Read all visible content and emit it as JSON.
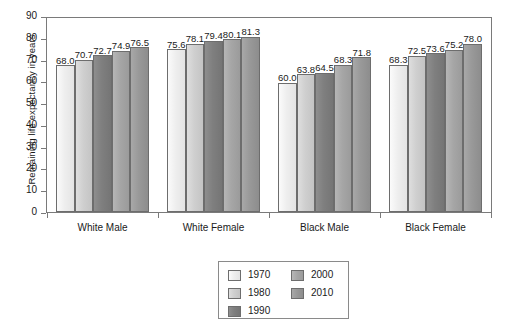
{
  "chart_data": {
    "type": "bar",
    "title": "",
    "xlabel": "",
    "ylabel": "Remaining life expectancy in years",
    "ylim": [
      0,
      90
    ],
    "yticks": [
      0,
      10,
      20,
      30,
      40,
      50,
      60,
      70,
      80,
      90
    ],
    "grid": false,
    "legend_position": "bottom-center",
    "categories": [
      "White Male",
      "White Female",
      "Black Male",
      "Black Female"
    ],
    "series": [
      {
        "name": "1970",
        "color": "#eeeeee",
        "values": [
          68.0,
          75.6,
          60.0,
          68.3
        ]
      },
      {
        "name": "1980",
        "color": "#cfcfcf",
        "values": [
          70.7,
          78.1,
          63.8,
          72.5
        ]
      },
      {
        "name": "1990",
        "color": "#7f7f7f",
        "values": [
          72.7,
          79.4,
          64.5,
          73.6
        ]
      },
      {
        "name": "2000",
        "color": "#a6a6a6",
        "values": [
          74.9,
          80.1,
          68.3,
          75.2
        ]
      },
      {
        "name": "2010",
        "color": "#999999",
        "values": [
          76.5,
          81.3,
          71.8,
          78.0
        ]
      }
    ],
    "data_labels": [
      [
        "68.0",
        "70.7",
        "72.7",
        "74.9",
        "76.5"
      ],
      [
        "75.6",
        "78.1",
        "79.4",
        "80.1",
        "81.3"
      ],
      [
        "60.0",
        "63.8",
        "64.5",
        "68.3",
        "71.8"
      ],
      [
        "68.3",
        "72.5",
        "73.6",
        "75.2",
        "78.0"
      ]
    ]
  },
  "axis": {
    "y_title": "Remaining life expectancy in years",
    "y_tick_labels": [
      "90",
      "80",
      "70",
      "60",
      "50",
      "40",
      "30",
      "20",
      "10",
      "0"
    ]
  },
  "legend": {
    "left_column": [
      "1970",
      "1980",
      "1990"
    ],
    "right_column": [
      "2000",
      "2010"
    ]
  }
}
